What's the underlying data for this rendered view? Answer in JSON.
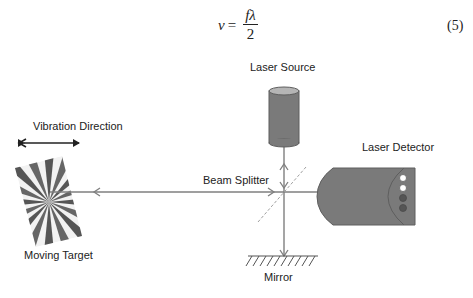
{
  "equation": {
    "lhs": "v",
    "equals": "=",
    "numerator": "fλ",
    "denominator": "2",
    "number": "(5)"
  },
  "diagram": {
    "labels": {
      "laser_source": "Laser Source",
      "laser_detector": "Laser Detector",
      "beam_splitter": "Beam Splitter",
      "mirror": "Mirror",
      "moving_target": "Moving Target",
      "vibration_direction": "Vibration Direction"
    },
    "colors": {
      "beam": "#7f7f7f",
      "device_fill": "#7a7a7a",
      "device_stroke": "#5e5e5e",
      "text": "#222222",
      "splitter": "#a0a0a0"
    }
  }
}
